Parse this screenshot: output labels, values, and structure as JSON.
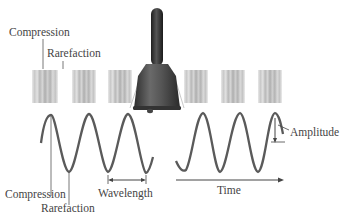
{
  "labels": {
    "compression_top": "Compression",
    "rarefaction_top": "Rarefaction",
    "compression_bottom": "Compression",
    "rarefaction_bottom": "Rarefaction",
    "wavelength": "Wavelength",
    "amplitude": "Amplitude",
    "time": "Time"
  },
  "diagram": {
    "sound_bands_left": 3,
    "sound_bands_right": 3,
    "wave_left_crests": 3,
    "wave_right_crests": 3
  },
  "colors": {
    "wave": "#5a5a5a",
    "bell_body": "#5c5c5c",
    "bell_handle": "#3c3c3c",
    "text": "#444444",
    "bands": "#b5b5b5"
  }
}
